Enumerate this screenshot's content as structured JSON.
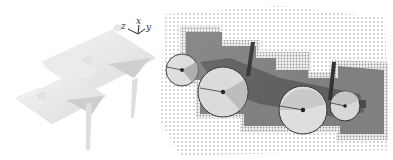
{
  "figure": {
    "left_panel": {
      "description": "3D rendered mesh object with coordinate frame",
      "axes_gizmo": {
        "labels": {
          "x": "x",
          "y": "y",
          "z": "z"
        }
      },
      "mesh_color": "#e6e6e6",
      "shadow_color": "#c9c9c9"
    },
    "right_panel": {
      "description": "Top-down occupancy map with fitted circles",
      "colors": {
        "free_dots": "#b5b5b5",
        "occupied_border": "#9a9a9a",
        "occupied_region": "#7d7d7d",
        "object_core": "#5a5a5a",
        "circle_fill": "#d9d9d9",
        "circle_stroke": "#333333",
        "post": "#3a3a3a"
      },
      "circles": [
        {
          "id": "circle-1",
          "label": "small-left"
        },
        {
          "id": "circle-2",
          "label": "large-left"
        },
        {
          "id": "circle-3",
          "label": "large-right"
        },
        {
          "id": "circle-4",
          "label": "small-right"
        }
      ]
    }
  }
}
